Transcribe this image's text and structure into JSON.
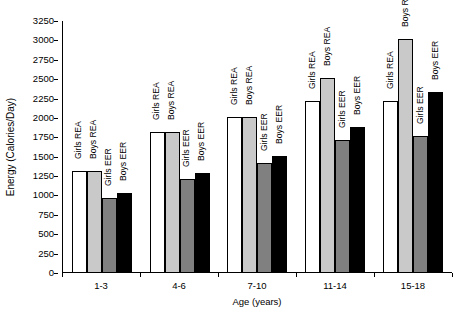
{
  "chart_data": {
    "type": "bar",
    "title": "",
    "xlabel": "Age (years)",
    "ylabel": "Energy (Calories/Day)",
    "categories": [
      "1-3",
      "4-6",
      "7-10",
      "11-14",
      "15-18"
    ],
    "ylim": [
      0,
      3250
    ],
    "ytick_step": 250,
    "yticks": [
      3250,
      3000,
      2750,
      2500,
      2250,
      2000,
      1750,
      1500,
      1250,
      1000,
      750,
      500,
      250,
      0
    ],
    "grid": false,
    "legend_position": "none",
    "bar_labels_inline": true,
    "series": [
      {
        "name": "Girls REA",
        "color": "#ffffff",
        "fill_class": "fill-white",
        "values": [
          1300,
          1800,
          2000,
          2200,
          2200
        ]
      },
      {
        "name": "Boys REA",
        "color": "#c9c9c9",
        "fill_class": "fill-ltgray",
        "values": [
          1300,
          1800,
          2000,
          2500,
          3000
        ]
      },
      {
        "name": "Girls EER",
        "color": "#808080",
        "fill_class": "fill-dkgray",
        "values": [
          950,
          1200,
          1400,
          1700,
          1750
        ]
      },
      {
        "name": "Boys EER",
        "color": "#000000",
        "fill_class": "fill-black",
        "values": [
          1020,
          1280,
          1500,
          1870,
          2320
        ]
      }
    ]
  }
}
